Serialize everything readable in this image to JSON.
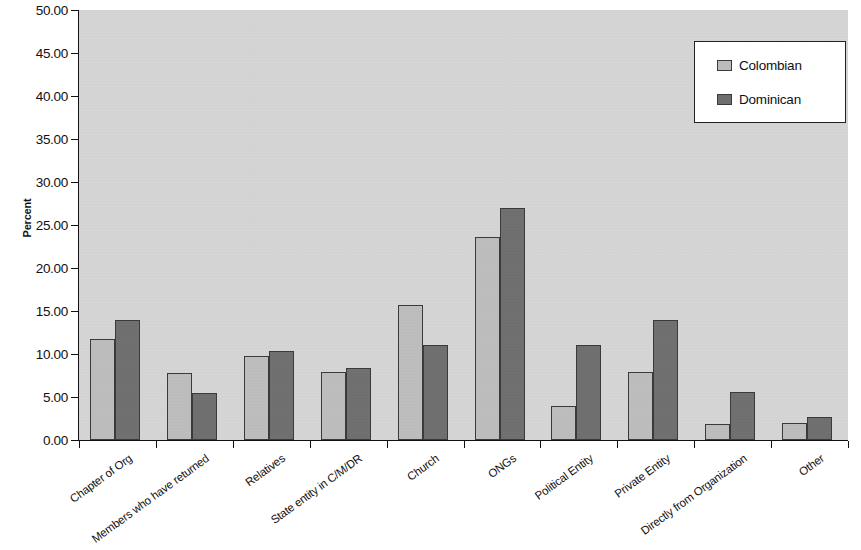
{
  "chart_data": {
    "type": "bar",
    "title": "",
    "subtitle": "",
    "xlabel": "",
    "ylabel": "Percent",
    "ylim": [
      0,
      50
    ],
    "ytick_step": 5,
    "ytick_labels": [
      "50.00",
      "45.00",
      "40.00",
      "35.00",
      "30.00",
      "25.00",
      "20.00",
      "15.00",
      "10.00",
      "5.00",
      "0.00"
    ],
    "ytick_values": [
      50,
      45,
      40,
      35,
      30,
      25,
      20,
      15,
      10,
      5,
      0
    ],
    "grid": false,
    "legend_position": "top-right",
    "categories": [
      "Chapter of Org",
      "Members who have returned",
      "Relatives",
      "State entity in C/M/DR",
      "Church",
      "ONGs",
      "Political Entity",
      "Private Entity",
      "Directly from Organization",
      "Other"
    ],
    "series": [
      {
        "name": "Colombian",
        "color": "#bdbdbd",
        "values": [
          11.7,
          7.8,
          9.8,
          7.9,
          15.7,
          23.6,
          3.9,
          7.9,
          1.9,
          2.0
        ]
      },
      {
        "name": "Dominican",
        "color": "#6e6e6e",
        "values": [
          13.9,
          5.5,
          10.3,
          8.4,
          11.1,
          27.0,
          11.1,
          13.9,
          5.6,
          2.7
        ]
      }
    ]
  },
  "plot": {
    "background_color": "#d9d9d9",
    "axis_color": "#111111",
    "legend_background": "#ffffff",
    "legend_border": "#222222"
  }
}
